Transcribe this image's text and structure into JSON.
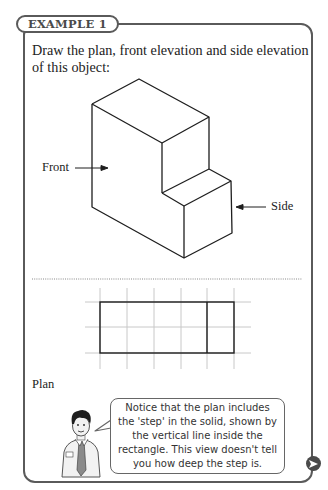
{
  "example_label": "EXAMPLE 1",
  "prompt": "Draw the plan, front elevation and side elevation of this object:",
  "figure": {
    "front_label": "Front",
    "side_label": "Side"
  },
  "plan": {
    "label": "Plan",
    "grid": {
      "columns": 6,
      "rows": 3
    },
    "note": "Notice that the plan includes the 'step' in the solid, shown by the vertical line inside the rectangle. This view doesn't tell you how deep the step is."
  },
  "navigation": {
    "next_icon": "next-arrow-icon"
  },
  "colors": {
    "frame": "#5a5a5a",
    "grid": "#c8c8c8",
    "ink": "#1e1e1e"
  }
}
